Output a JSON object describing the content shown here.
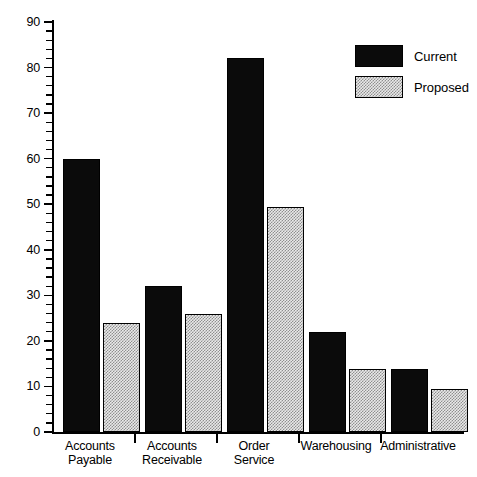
{
  "chart_data": {
    "type": "bar",
    "title": "",
    "subtitle": "",
    "xlabel": "",
    "ylabel": "",
    "categories": [
      "Accounts Payable",
      "Accounts Receivable",
      "Order Service",
      "Warehousing",
      "Administrative"
    ],
    "category_lines": [
      [
        "Accounts",
        "Payable"
      ],
      [
        "Accounts",
        "Receivable"
      ],
      [
        "Order",
        "Service"
      ],
      [
        "Warehousing",
        ""
      ],
      [
        "Administrative",
        ""
      ]
    ],
    "series": [
      {
        "name": "Current",
        "color": "#0b0b0b",
        "fill": "solid",
        "values": [
          60,
          32,
          82,
          22,
          13.8
        ]
      },
      {
        "name": "Proposed",
        "color": "#e9e9e9",
        "fill": "stipple",
        "values": [
          24,
          26,
          49.5,
          13.8,
          9.5
        ]
      }
    ],
    "ylim": [
      0,
      90
    ],
    "ymajor_ticks": [
      0,
      10,
      20,
      30,
      40,
      50,
      60,
      70,
      80,
      90
    ],
    "ytick_labels": [
      "0",
      "10",
      "20",
      "30",
      "40",
      "50",
      "60",
      "70",
      "80",
      "90"
    ],
    "yminor_step": 2,
    "grid": false,
    "legend": {
      "position": "top-right",
      "entries": [
        "Current",
        "Proposed"
      ]
    }
  }
}
